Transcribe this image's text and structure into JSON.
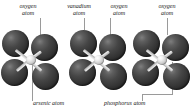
{
  "figure": {
    "type": "molecular-structure-diagram",
    "background_color": "#ffffff",
    "sphere_color": "#3a3a3a",
    "core_color": "#d8d8d8",
    "leader_color": "#9a9a9a",
    "text_color": "#1b1b1b"
  },
  "labels": {
    "oxygen_left": {
      "line1": "oxygen",
      "line2": "atom"
    },
    "vanadium": {
      "line1": "vanadium",
      "line2": "atom"
    },
    "oxygen_middle": {
      "line1": "oxygen",
      "line2": "atom"
    },
    "oxygen_right": {
      "line1": "oxygen",
      "line2": "atom"
    },
    "arsenic": {
      "line1": "arsenic atom"
    },
    "phosphorus": {
      "line1": "phosphorus atom"
    }
  },
  "clusters": [
    {
      "name": "arsenate-tetrahedron",
      "center_atom": "arsenic",
      "outer_atoms": [
        "oxygen",
        "oxygen",
        "oxygen",
        "oxygen"
      ],
      "outer_count": 4
    },
    {
      "name": "vanadate-tetrahedron",
      "center_atom": "vanadium",
      "outer_atoms": [
        "oxygen",
        "oxygen",
        "oxygen",
        "oxygen"
      ],
      "outer_count": 4
    },
    {
      "name": "phosphate-tetrahedron",
      "center_atom": "phosphorus",
      "outer_atoms": [
        "oxygen",
        "oxygen",
        "oxygen",
        "oxygen"
      ],
      "outer_count": 4
    }
  ]
}
